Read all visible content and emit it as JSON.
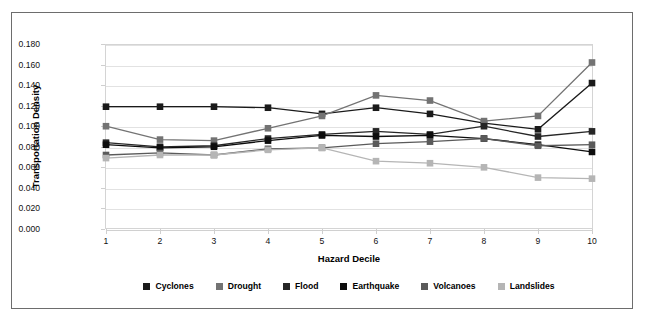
{
  "top_strip": {
    "clipped_text": "·  ·  ·  ·  ·  ·"
  },
  "axes": {
    "ylabel": "Transportation Density",
    "xlabel": "Hazard Decile",
    "yticks": [
      "0.000",
      "0.020",
      "0.040",
      "0.060",
      "0.080",
      "0.100",
      "0.120",
      "0.140",
      "0.160",
      "0.180"
    ],
    "xticks": [
      "1",
      "2",
      "3",
      "4",
      "5",
      "6",
      "7",
      "8",
      "9",
      "10"
    ]
  },
  "legend": {
    "items": [
      {
        "label": "Cyclones",
        "color": "#1a1a1a"
      },
      {
        "label": "Drought",
        "color": "#737373"
      },
      {
        "label": "Flood",
        "color": "#262626"
      },
      {
        "label": "Earthquake",
        "color": "#0d0d0d"
      },
      {
        "label": "Volcanoes",
        "color": "#5a5a5a"
      },
      {
        "label": "Landslides",
        "color": "#b5b5b5"
      }
    ]
  },
  "chart_data": {
    "type": "line",
    "title": "",
    "xlabel": "Hazard Decile",
    "ylabel": "Transportation Density",
    "x": [
      1,
      2,
      3,
      4,
      5,
      6,
      7,
      8,
      9,
      10
    ],
    "xlim": [
      1,
      10
    ],
    "ylim": [
      0.0,
      0.18
    ],
    "ytick_step": 0.02,
    "grid": true,
    "markers": "square",
    "legend_position": "bottom",
    "series": [
      {
        "name": "Cyclones",
        "color": "#1a1a1a",
        "values": [
          0.119,
          0.119,
          0.119,
          0.118,
          0.112,
          0.118,
          0.112,
          0.103,
          0.097,
          0.142
        ]
      },
      {
        "name": "Drought",
        "color": "#737373",
        "values": [
          0.1,
          0.087,
          0.086,
          0.098,
          0.11,
          0.13,
          0.125,
          0.105,
          0.11,
          0.162
        ]
      },
      {
        "name": "Flood",
        "color": "#262626",
        "values": [
          0.084,
          0.08,
          0.081,
          0.088,
          0.092,
          0.095,
          0.092,
          0.1,
          0.09,
          0.095
        ]
      },
      {
        "name": "Earthquake",
        "color": "#0d0d0d",
        "values": [
          0.082,
          0.079,
          0.08,
          0.086,
          0.091,
          0.09,
          0.091,
          0.088,
          0.082,
          0.075
        ]
      },
      {
        "name": "Volcanoes",
        "color": "#5a5a5a",
        "values": [
          0.072,
          0.074,
          0.072,
          0.078,
          0.079,
          0.083,
          0.085,
          0.088,
          0.081,
          0.082
        ]
      },
      {
        "name": "Landslides",
        "color": "#b5b5b5",
        "values": [
          0.069,
          0.072,
          0.072,
          0.077,
          0.079,
          0.066,
          0.064,
          0.06,
          0.05,
          0.049
        ]
      }
    ]
  }
}
